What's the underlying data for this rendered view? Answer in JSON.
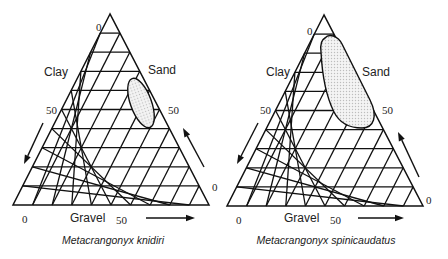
{
  "diagrams": [
    {
      "id": "knidiri",
      "caption": "Metacrangonyx knidiri",
      "axes": {
        "left_label": "Clay",
        "right_label": "Sand",
        "bottom_label": "Gravel"
      },
      "ticks": {
        "apex_zero": "0",
        "left_fifty": "50",
        "right_fifty": "50",
        "bottom_left_zero": "0",
        "bottom_fifty": "50",
        "bottom_right_zero": "0"
      },
      "geometry": {
        "apex": [
          110,
          14
        ],
        "bottom_left": [
          13,
          205
        ],
        "bottom_right": [
          209,
          205
        ],
        "divisions": 10
      },
      "habitat_region": {
        "cx": 141,
        "cy": 103,
        "rx": 10.5,
        "ry": 26,
        "rotate": -20
      },
      "caption_pos": [
        113,
        244
      ],
      "labels_pos": {
        "apex_zero": [
          96,
          31
        ],
        "clay": [
          44,
          76
        ],
        "sand": [
          148,
          74
        ],
        "left_fifty": [
          46,
          114
        ],
        "right_fifty": [
          168,
          114
        ],
        "bottom_left_zero": [
          22,
          223
        ],
        "gravel": [
          70,
          222
        ],
        "bottom_fifty": [
          116,
          224
        ],
        "bottom_right_zero": [
          212,
          191
        ]
      },
      "arrows": {
        "left": [
          [
            43,
            123
          ],
          [
            24,
            164
          ]
        ],
        "right": [
          [
            204,
            167
          ],
          [
            183,
            128
          ]
        ],
        "bottom": [
          [
            146,
            218
          ],
          [
            195,
            218
          ]
        ]
      }
    },
    {
      "id": "spinicaudatus",
      "caption": "Metacrangonyx spinicaudatus",
      "axes": {
        "left_label": "Clay",
        "right_label": "Sand",
        "bottom_label": "Gravel"
      },
      "ticks": {
        "apex_zero": "0",
        "left_fifty": "50",
        "right_fifty": "50",
        "bottom_left_zero": "0",
        "bottom_fifty": "50",
        "bottom_right_zero": "0"
      },
      "geometry": {
        "apex": [
          324,
          15
        ],
        "bottom_left": [
          227,
          206
        ],
        "bottom_right": [
          423,
          206
        ],
        "divisions": 10
      },
      "habitat_region_path": "M 325 38 C 329 33, 338 36, 342 44 L 370 100 C 378 116, 374 128, 362 128 C 350 128, 340 124, 334 112 C 326 96, 322 72, 321 52 C 320 44, 321 40, 325 38 Z",
      "caption_pos": [
        326,
        244
      ],
      "labels_pos": {
        "apex_zero": [
          307,
          35
        ],
        "clay": [
          266,
          76
        ],
        "sand": [
          362,
          76
        ],
        "left_fifty": [
          260,
          114
        ],
        "right_fifty": [
          382,
          114
        ],
        "bottom_left_zero": [
          236,
          224
        ],
        "gravel": [
          284,
          222
        ],
        "bottom_fifty": [
          330,
          224
        ],
        "bottom_right_zero": [
          426,
          204
        ]
      },
      "arrows": {
        "left": [
          [
            258,
            123
          ],
          [
            237,
            164
          ]
        ],
        "right": [
          [
            419,
            177
          ],
          [
            398,
            132
          ]
        ],
        "bottom": [
          [
            358,
            218
          ],
          [
            404,
            218
          ]
        ]
      }
    }
  ],
  "colors": {
    "ink": "#111111",
    "fill_dots": "#bdbdbd",
    "background": "#ffffff"
  }
}
